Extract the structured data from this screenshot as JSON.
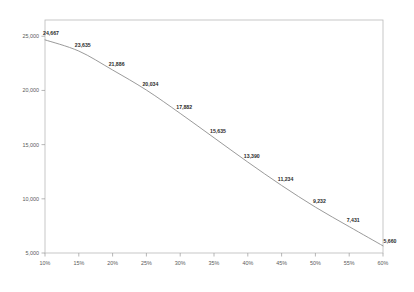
{
  "chart_data": {
    "type": "line",
    "title": "",
    "subtitle": "",
    "xlabel": "",
    "ylabel": "",
    "categories": [
      "10%",
      "15%",
      "20%",
      "25%",
      "30%",
      "35%",
      "40%",
      "45%",
      "50%",
      "55%",
      "60%"
    ],
    "x": [
      10,
      15,
      20,
      25,
      30,
      35,
      40,
      45,
      50,
      55,
      60
    ],
    "values": [
      24667,
      23635,
      21886,
      20034,
      17882,
      15635,
      13390,
      11234,
      9232,
      7431,
      5660
    ],
    "point_labels": [
      "24,667",
      "23,635",
      "21,886",
      "20,034",
      "17,882",
      "15,635",
      "13,390",
      "11,234",
      "9,232",
      "7,431",
      "5,660"
    ],
    "series": [
      {
        "name": "series-1",
        "values": [
          24667,
          23635,
          21886,
          20034,
          17882,
          15635,
          13390,
          11234,
          9232,
          7431,
          5660
        ],
        "color": "#8f8f8f"
      }
    ],
    "xlim": [
      10,
      60
    ],
    "ylim": [
      5000,
      26500
    ],
    "y_ticks": [
      5000,
      10000,
      15000,
      20000,
      25000
    ],
    "y_tick_labels": [
      "5,000",
      "10,000",
      "15,000",
      "20,000",
      "25,000"
    ],
    "x_ticks": [
      10,
      15,
      20,
      25,
      30,
      35,
      40,
      45,
      50,
      55,
      60
    ],
    "x_tick_labels": [
      "10%",
      "15%",
      "20%",
      "25%",
      "30%",
      "35%",
      "40%",
      "45%",
      "50%",
      "55%",
      "60%"
    ],
    "grid": false,
    "legend": false,
    "legend_position": "none",
    "line_color": "#8f8f8f",
    "border_color": "#b9b9b9",
    "label_color": "#2b2b2b",
    "tick_color": "#5a5a5a",
    "background": "#ffffff"
  },
  "plot": {
    "left": 45,
    "right": 383,
    "top": 20,
    "bottom": 253
  }
}
